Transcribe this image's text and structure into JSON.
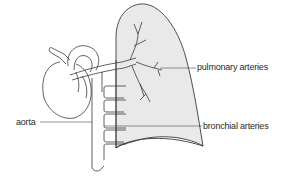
{
  "figure": {
    "colors": {
      "line": "#3a3a3a",
      "lung_fill": "#e9e9e9",
      "background": "#ffffff",
      "label_text": "#2a2a2a"
    },
    "labels": {
      "pulmonary_arteries": "pulmonary arteries",
      "bronchial_arteries": "bronchial arteries",
      "aorta": "aorta"
    }
  }
}
